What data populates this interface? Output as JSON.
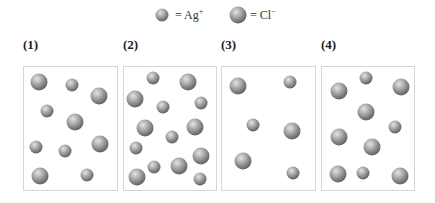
{
  "legend": {
    "items": [
      {
        "ion": "Ag",
        "charge": "+",
        "label": "= Ag",
        "type": "small",
        "cx": 162,
        "cy": 15,
        "r": 6.5,
        "text_x": 175
      },
      {
        "ion": "Cl",
        "charge": "−",
        "label": "= Cl",
        "type": "large",
        "cx": 238,
        "cy": 15,
        "r": 8.5,
        "text_x": 250
      }
    ]
  },
  "colors": {
    "sphere_highlight": "#e2e2e2",
    "sphere_mid": "#a6a6a6",
    "sphere_edge": "#626262",
    "box_border": "#d6d6d6"
  },
  "panels": [
    {
      "label": "(1)",
      "label_x": 23,
      "box": {
        "x": 23,
        "w": 95
      },
      "particles": [
        {
          "type": "large",
          "x": 39,
          "y": 82
        },
        {
          "type": "small",
          "x": 72,
          "y": 85
        },
        {
          "type": "large",
          "x": 99,
          "y": 96
        },
        {
          "type": "small",
          "x": 47,
          "y": 111
        },
        {
          "type": "large",
          "x": 75,
          "y": 122
        },
        {
          "type": "small",
          "x": 36,
          "y": 147
        },
        {
          "type": "small",
          "x": 65,
          "y": 151
        },
        {
          "type": "large",
          "x": 100,
          "y": 144
        },
        {
          "type": "large",
          "x": 40,
          "y": 176
        },
        {
          "type": "small",
          "x": 87,
          "y": 175
        }
      ]
    },
    {
      "label": "(2)",
      "label_x": 123,
      "box": {
        "x": 123,
        "w": 94
      },
      "particles": [
        {
          "type": "small",
          "x": 153,
          "y": 78
        },
        {
          "type": "large",
          "x": 188,
          "y": 82
        },
        {
          "type": "large",
          "x": 135,
          "y": 99
        },
        {
          "type": "small",
          "x": 163,
          "y": 107
        },
        {
          "type": "small",
          "x": 201,
          "y": 103
        },
        {
          "type": "large",
          "x": 145,
          "y": 128
        },
        {
          "type": "large",
          "x": 195,
          "y": 127
        },
        {
          "type": "small",
          "x": 172,
          "y": 137
        },
        {
          "type": "small",
          "x": 136,
          "y": 148
        },
        {
          "type": "large",
          "x": 201,
          "y": 156
        },
        {
          "type": "small",
          "x": 154,
          "y": 167
        },
        {
          "type": "large",
          "x": 179,
          "y": 166
        },
        {
          "type": "large",
          "x": 137,
          "y": 177
        },
        {
          "type": "small",
          "x": 200,
          "y": 179
        }
      ]
    },
    {
      "label": "(3)",
      "label_x": 221,
      "box": {
        "x": 221,
        "w": 95
      },
      "particles": [
        {
          "type": "large",
          "x": 238,
          "y": 86
        },
        {
          "type": "small",
          "x": 290,
          "y": 82
        },
        {
          "type": "small",
          "x": 253,
          "y": 125
        },
        {
          "type": "large",
          "x": 292,
          "y": 131
        },
        {
          "type": "large",
          "x": 243,
          "y": 161
        },
        {
          "type": "small",
          "x": 293,
          "y": 173
        }
      ]
    },
    {
      "label": "(4)",
      "label_x": 321,
      "box": {
        "x": 321,
        "w": 94
      },
      "particles": [
        {
          "type": "small",
          "x": 366,
          "y": 78
        },
        {
          "type": "large",
          "x": 339,
          "y": 91
        },
        {
          "type": "large",
          "x": 401,
          "y": 87
        },
        {
          "type": "large",
          "x": 366,
          "y": 112
        },
        {
          "type": "small",
          "x": 395,
          "y": 127
        },
        {
          "type": "large",
          "x": 339,
          "y": 137
        },
        {
          "type": "large",
          "x": 372,
          "y": 147
        },
        {
          "type": "large",
          "x": 338,
          "y": 174
        },
        {
          "type": "small",
          "x": 363,
          "y": 173
        },
        {
          "type": "large",
          "x": 400,
          "y": 176
        }
      ]
    }
  ],
  "sizes": {
    "small": 6.5,
    "large": 8.5
  }
}
